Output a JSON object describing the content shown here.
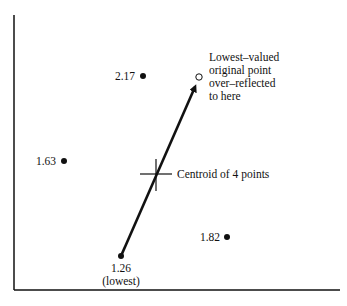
{
  "diagram": {
    "title": "",
    "points": [
      {
        "id": "p217",
        "label": "2.17",
        "x": 143,
        "y": 76,
        "filled": true
      },
      {
        "id": "p163",
        "label": "1.63",
        "x": 64,
        "y": 161,
        "filled": true
      },
      {
        "id": "p182",
        "label": "1.82",
        "x": 227,
        "y": 237,
        "filled": true
      },
      {
        "id": "p126",
        "label": "1.26",
        "sublabel": "(lowest)",
        "x": 121,
        "y": 256,
        "filled": true
      },
      {
        "id": "reflected",
        "label": "",
        "x": 199,
        "y": 77,
        "filled": false
      }
    ],
    "reflected_annotation": {
      "lines": [
        "Lowest–valued",
        "original point",
        "over–reflected",
        "to here"
      ]
    },
    "centroid_annotation": "Centroid of 4 points",
    "colors": {
      "ink": "#111111",
      "background": "#ffffff"
    }
  }
}
